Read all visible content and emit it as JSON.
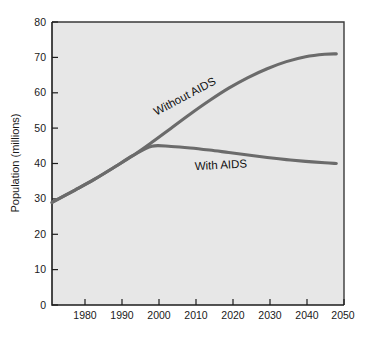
{
  "chart_data": {
    "type": "line",
    "title": "",
    "subtitle": "",
    "xlabel": "",
    "ylabel": "Population (millions)",
    "xlim": [
      1974,
      2050
    ],
    "ylim": [
      0,
      80
    ],
    "grid": false,
    "legend_position": "inline-annotations",
    "xticks": [
      "1980",
      "1990",
      "2000",
      "2010",
      "2020",
      "2030",
      "2040",
      "2050"
    ],
    "xtick_values": [
      1980,
      1990,
      2000,
      2010,
      2020,
      2030,
      2040,
      2050
    ],
    "yticks": [
      "0",
      "10",
      "20",
      "30",
      "40",
      "50",
      "60",
      "70",
      "80"
    ],
    "ytick_values": [
      0,
      10,
      20,
      30,
      40,
      50,
      60,
      70,
      80
    ],
    "x": [
      1974,
      1980,
      1985,
      1990,
      1995,
      2000,
      2005,
      2010,
      2015,
      2020,
      2025,
      2030,
      2035,
      2040,
      2045,
      2048
    ],
    "series": [
      {
        "name": "Without AIDS",
        "label": "Without AIDS",
        "color": "#6b6b6b",
        "values": [
          29.0,
          32.5,
          35.5,
          38.8,
          42.2,
          46.0,
          50.0,
          54.0,
          57.8,
          61.3,
          64.3,
          66.8,
          68.8,
          70.2,
          70.9,
          71.0
        ]
      },
      {
        "name": "With AIDS",
        "label": "With AIDS",
        "color": "#6b6b6b",
        "values": [
          29.0,
          32.5,
          35.5,
          38.8,
          42.2,
          44.9,
          44.8,
          44.4,
          43.8,
          43.1,
          42.4,
          41.7,
          41.1,
          40.6,
          40.2,
          40.0
        ]
      }
    ],
    "annotations": [
      {
        "text": "Without AIDS",
        "x": 2009,
        "y": 58.0,
        "rotation": -28
      },
      {
        "text": "With AIDS",
        "x": 2018,
        "y": 38.5,
        "rotation": -3
      }
    ],
    "colors": {
      "plot_background": "#e7e7e7",
      "page_background": "#ffffff",
      "curve": "#6b6b6b",
      "axis": "#1d1d1d",
      "text": "#1a1a1a"
    }
  }
}
